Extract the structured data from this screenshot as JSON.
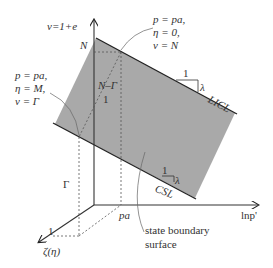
{
  "axes": {
    "vertical": "v=1+e",
    "horizontal": "lnp'",
    "depth": "ζ(η)"
  },
  "labels": {
    "N": "N",
    "N_minus_Gamma": "N–Γ",
    "one_slope_left": "1",
    "Gamma": "Γ",
    "p_a": "pa",
    "one_depth": "1",
    "top_annotation": [
      "p = pa,",
      "η = 0,",
      "v = N"
    ],
    "left_annotation": [
      "p = pa,",
      "η = M,",
      "v = Γ"
    ],
    "licl": "LICL",
    "csl": "CSL",
    "licl_slope_run": "1",
    "licl_slope_rise": "λ",
    "csl_slope_run": "1",
    "csl_slope_rise": "λ",
    "surface": [
      "state boundary",
      "surface"
    ]
  },
  "colors": {
    "surface_fill": "#a9a9a9",
    "line": "#222222",
    "dashed": "#555555"
  }
}
